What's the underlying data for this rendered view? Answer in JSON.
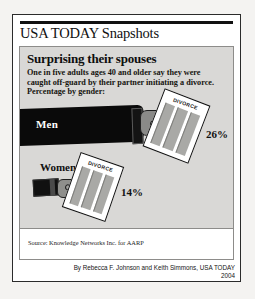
{
  "masthead": {
    "brand": "USA TODAY Snapshots"
  },
  "snapshot": {
    "headline": "Surprising their spouses",
    "deck_lines": [
      "One in five adults ages 40 and older say they were",
      "caught off-guard by their partner initiating a divorce.",
      "Percentage by gender:"
    ],
    "source": "Source: Knowledge Networks Inc. for AARP",
    "byline": "By Rebecca F. Johnson and Keith Simmons, USA TODAY",
    "year": "2004",
    "document_label": "DIVORCE"
  },
  "chart_data": {
    "type": "bar",
    "title": "Surprising their spouses",
    "subtitle": "One in five adults ages 40 and older say they were caught off-guard by their partner initiating a divorce. Percentage by gender:",
    "categories": [
      "Men",
      "Women"
    ],
    "values": [
      26,
      14
    ],
    "value_labels": [
      "26%",
      "14%"
    ],
    "xlabel": "",
    "ylabel": "Percentage",
    "ylim": [
      0,
      30
    ],
    "grid": false,
    "legend": "none",
    "annotation": "Pictorial bars drawn as arms holding DIVORCE papers; arm length encodes the percentage."
  },
  "colors": {
    "panel_background": "#d9d8d6",
    "ink": "#111111",
    "paper_white": "#ffffff",
    "hand_gray": "#8a8a88",
    "page_background": "#f4f3f1"
  }
}
